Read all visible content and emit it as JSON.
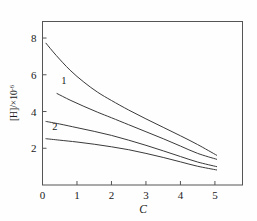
{
  "chart_data": {
    "type": "line",
    "title": "",
    "xlabel": "C",
    "ylabel": "[H]/×10",
    "ylabel_exponent": "-6",
    "xlim": [
      0,
      5.8
    ],
    "ylim": [
      0,
      8.9
    ],
    "xticks": [
      0,
      1,
      2,
      3,
      4,
      5
    ],
    "xticklabels": [
      "0",
      "1",
      "2",
      "3",
      "4",
      "5"
    ],
    "yticks": [
      2,
      4,
      6,
      8
    ],
    "yticklabels": [
      "2",
      "4",
      "6",
      "8"
    ],
    "grid": false,
    "legend": "none",
    "annotations": [
      {
        "text": "1",
        "x": 0.62,
        "y": 5.52
      },
      {
        "text": "2",
        "x": 0.36,
        "y": 2.98
      }
    ],
    "series": [
      {
        "name": "curve-1",
        "x": [
          0.1,
          0.4,
          0.8,
          1.2,
          1.6,
          2.0,
          2.5,
          3.0,
          3.5,
          4.0,
          4.5,
          5.05
        ],
        "y": [
          7.72,
          7.05,
          6.25,
          5.6,
          5.05,
          4.6,
          4.08,
          3.6,
          3.14,
          2.68,
          2.2,
          1.62
        ]
      },
      {
        "name": "curve-2",
        "x": [
          0.42,
          0.8,
          1.2,
          1.6,
          2.0,
          2.5,
          3.0,
          3.5,
          4.0,
          4.5,
          5.05
        ],
        "y": [
          4.98,
          4.62,
          4.28,
          3.96,
          3.66,
          3.28,
          2.9,
          2.52,
          2.12,
          1.72,
          1.4
        ]
      },
      {
        "name": "curve-3",
        "x": [
          0.1,
          0.5,
          1.0,
          1.5,
          2.0,
          2.5,
          3.0,
          3.5,
          4.0,
          4.5,
          5.05
        ],
        "y": [
          3.46,
          3.32,
          3.12,
          2.92,
          2.7,
          2.44,
          2.16,
          1.86,
          1.55,
          1.25,
          1.0
        ]
      },
      {
        "name": "curve-4",
        "x": [
          0.1,
          0.5,
          1.0,
          1.5,
          2.0,
          2.5,
          3.0,
          3.5,
          4.0,
          4.5,
          5.05
        ],
        "y": [
          2.52,
          2.44,
          2.34,
          2.22,
          2.08,
          1.92,
          1.72,
          1.5,
          1.26,
          1.02,
          0.82
        ]
      }
    ]
  }
}
